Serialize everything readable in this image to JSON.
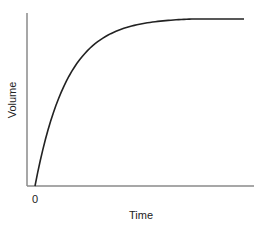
{
  "chart_data": {
    "type": "line",
    "title": "",
    "xlabel": "Time",
    "ylabel": "Volume",
    "x_ticks": [
      "0"
    ],
    "y_ticks": [],
    "grid": false,
    "legend": null,
    "series": [
      {
        "name": "Volume",
        "x": [
          0,
          0.05,
          0.1,
          0.2,
          0.3,
          0.4,
          0.5,
          0.6,
          0.7,
          0.8,
          0.9,
          1.0
        ],
        "values": [
          0,
          0.28,
          0.52,
          0.72,
          0.85,
          0.93,
          0.97,
          0.99,
          1.0,
          1.0,
          1.0,
          1.0
        ]
      }
    ],
    "xlim": [
      0,
      1.05
    ],
    "ylim": [
      0,
      1.0
    ],
    "colors": {
      "curve": "#222222",
      "axes": "#888888"
    }
  }
}
